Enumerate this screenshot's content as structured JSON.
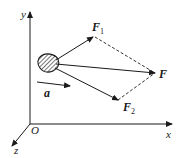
{
  "diagram": {
    "type": "force-vector-decomposition",
    "axes": {
      "x_label": "x",
      "y_label": "y",
      "z_label": "z",
      "origin_label": "O"
    },
    "vectors": {
      "F1": {
        "label": "F",
        "subscript": "1"
      },
      "F": {
        "label": "F"
      },
      "F2": {
        "label": "F",
        "subscript": "2"
      },
      "a": {
        "label": "a"
      }
    },
    "colors": {
      "stroke": "#1a1a1a",
      "background": "#ffffff"
    }
  }
}
